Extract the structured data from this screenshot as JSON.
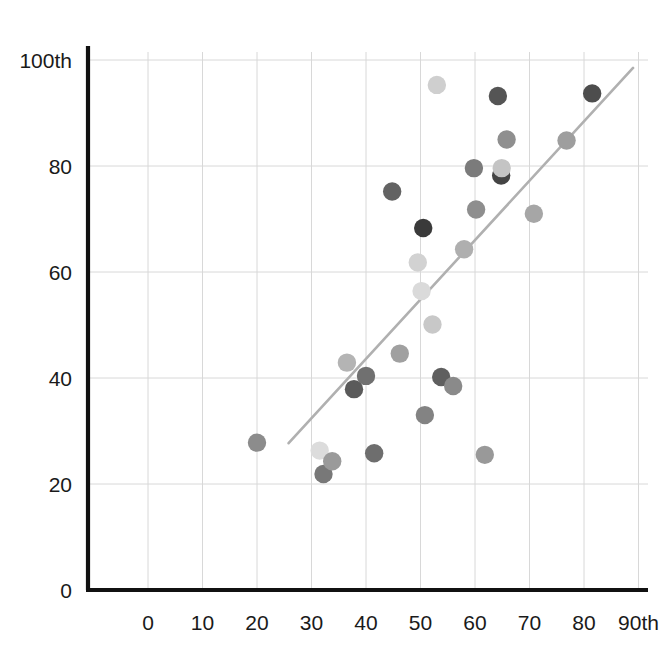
{
  "chart_data": {
    "type": "scatter",
    "title": "",
    "subtitle": "",
    "xlabel": "",
    "ylabel": "",
    "xlim": [
      0,
      95
    ],
    "ylim": [
      0,
      105
    ],
    "grid": true,
    "legend": null,
    "x_ticks": [
      {
        "value": 0,
        "label": "0"
      },
      {
        "value": 10,
        "label": "10"
      },
      {
        "value": 20,
        "label": "20"
      },
      {
        "value": 30,
        "label": "30"
      },
      {
        "value": 40,
        "label": "40"
      },
      {
        "value": 50,
        "label": "50"
      },
      {
        "value": 60,
        "label": "60"
      },
      {
        "value": 70,
        "label": "70"
      },
      {
        "value": 80,
        "label": "80"
      },
      {
        "value": 90,
        "label": "90th"
      }
    ],
    "y_ticks": [
      {
        "value": 0,
        "label": "0"
      },
      {
        "value": 20,
        "label": "20"
      },
      {
        "value": 40,
        "label": "40"
      },
      {
        "value": 60,
        "label": "60"
      },
      {
        "value": 80,
        "label": "80"
      },
      {
        "value": 100,
        "label": "100th"
      }
    ],
    "points": [
      {
        "x": 20.0,
        "y": 27.8,
        "color": "#8c8c8c"
      },
      {
        "x": 31.5,
        "y": 26.3,
        "color": "#dcdcdc"
      },
      {
        "x": 32.2,
        "y": 21.9,
        "color": "#787878"
      },
      {
        "x": 33.8,
        "y": 24.3,
        "color": "#9a9a9a"
      },
      {
        "x": 36.5,
        "y": 42.9,
        "color": "#b4b4b4"
      },
      {
        "x": 37.8,
        "y": 37.9,
        "color": "#5a5a5a"
      },
      {
        "x": 40.0,
        "y": 40.4,
        "color": "#707070"
      },
      {
        "x": 41.5,
        "y": 25.8,
        "color": "#6e6e6e"
      },
      {
        "x": 44.8,
        "y": 75.2,
        "color": "#636363"
      },
      {
        "x": 46.2,
        "y": 44.6,
        "color": "#a0a0a0"
      },
      {
        "x": 49.5,
        "y": 61.8,
        "color": "#d2d2d2"
      },
      {
        "x": 50.2,
        "y": 56.4,
        "color": "#dadada"
      },
      {
        "x": 50.5,
        "y": 68.3,
        "color": "#3a3a3a"
      },
      {
        "x": 50.8,
        "y": 33.0,
        "color": "#838383"
      },
      {
        "x": 52.2,
        "y": 50.1,
        "color": "#c8c8c8"
      },
      {
        "x": 53.0,
        "y": 95.3,
        "color": "#cfcfcf"
      },
      {
        "x": 53.8,
        "y": 40.2,
        "color": "#5f5f5f"
      },
      {
        "x": 56.0,
        "y": 38.5,
        "color": "#8a8a8a"
      },
      {
        "x": 58.0,
        "y": 64.3,
        "color": "#afafaf"
      },
      {
        "x": 59.8,
        "y": 79.6,
        "color": "#7b7b7b"
      },
      {
        "x": 60.2,
        "y": 71.8,
        "color": "#8e8e8e"
      },
      {
        "x": 61.8,
        "y": 25.5,
        "color": "#999999"
      },
      {
        "x": 64.2,
        "y": 93.2,
        "color": "#555555"
      },
      {
        "x": 64.8,
        "y": 78.2,
        "color": "#444444"
      },
      {
        "x": 64.9,
        "y": 79.6,
        "color": "#c4c4c4"
      },
      {
        "x": 65.8,
        "y": 85.0,
        "color": "#8f8f8f"
      },
      {
        "x": 70.8,
        "y": 71.0,
        "color": "#a6a6a6"
      },
      {
        "x": 76.8,
        "y": 84.8,
        "color": "#9e9e9e"
      },
      {
        "x": 81.5,
        "y": 93.7,
        "color": "#4d4d4d"
      }
    ],
    "trendline": {
      "x_start": 25.8,
      "y_start": 27.7,
      "x_end": 89.0,
      "y_end": 98.5,
      "color": "#b0b0b0"
    },
    "colors": {
      "axis": "#111111",
      "grid": "#d8d8d8",
      "background": "#ffffff"
    }
  }
}
